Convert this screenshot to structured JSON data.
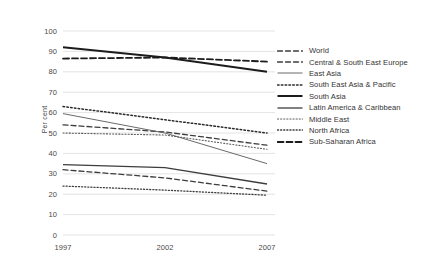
{
  "chart_data": {
    "type": "line",
    "title": "",
    "xlabel": "",
    "ylabel": "Per cent",
    "x": [
      1997,
      2002,
      2007
    ],
    "xtick_labels": [
      "1997",
      "2002",
      "2007"
    ],
    "ytick_labels": [
      "100",
      "90",
      "80",
      "70",
      "60",
      "50",
      "40",
      "30",
      "20",
      "10",
      "0"
    ],
    "ylim": [
      0,
      100
    ],
    "ytick_step": 10,
    "grid": "horizontal",
    "legend_position": "right",
    "series": [
      {
        "name": "World",
        "style": "dashed",
        "color": "#3d3d3d",
        "width": 1.3,
        "values": [
          54.0,
          50.5,
          44.0
        ]
      },
      {
        "name": "Central & South East Europe",
        "style": "dashed",
        "color": "#3d3d3d",
        "width": 1.3,
        "values": [
          32.0,
          28.0,
          21.5
        ]
      },
      {
        "name": "East Asia",
        "style": "solid",
        "color": "#6a6a6a",
        "width": 1.0,
        "values": [
          59.5,
          50.0,
          35.0
        ]
      },
      {
        "name": "South East Asia & Pacific",
        "style": "dotted",
        "color": "#2b2b2b",
        "width": 1.5,
        "values": [
          63.0,
          56.5,
          50.0
        ]
      },
      {
        "name": "South Asia",
        "style": "solid",
        "color": "#1c1c1c",
        "width": 2.0,
        "values": [
          92.0,
          87.0,
          80.0
        ]
      },
      {
        "name": "Latin America & Caribbean",
        "style": "solid",
        "color": "#3d3d3d",
        "width": 1.3,
        "values": [
          34.5,
          33.0,
          25.0
        ]
      },
      {
        "name": "Middle East",
        "style": "fine-dotted",
        "color": "#5a5a5a",
        "width": 1.1,
        "values": [
          50.0,
          49.0,
          42.0
        ]
      },
      {
        "name": "North Africa",
        "style": "fine-dotted",
        "color": "#3d3d3d",
        "width": 1.3,
        "values": [
          24.0,
          22.0,
          19.5
        ]
      },
      {
        "name": "Sub-Saharan Africa",
        "style": "dashed",
        "color": "#1c1c1c",
        "width": 1.8,
        "values": [
          86.5,
          87.0,
          85.0
        ]
      }
    ]
  },
  "legend": {
    "items": [
      {
        "label": "World"
      },
      {
        "label": "Central & South East Europe"
      },
      {
        "label": "East Asia"
      },
      {
        "label": "South East Asia & Pacific"
      },
      {
        "label": "South Asia"
      },
      {
        "label": "Latin America & Caribbean"
      },
      {
        "label": "Middle East"
      },
      {
        "label": "North Africa"
      },
      {
        "label": "Sub-Saharan Africa"
      }
    ]
  },
  "source_note": "",
  "colors": {
    "grid": "#dcdcdc",
    "text": "#4a4a4a",
    "background": "#ffffff"
  }
}
